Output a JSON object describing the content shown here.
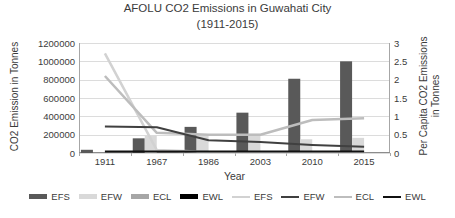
{
  "title": {
    "line1": "AFOLU CO2 Emissions in Guwahati City",
    "line2": "(1911-2015)"
  },
  "axes": {
    "left": {
      "label": "CO2 Emission in Tonnes"
    },
    "right": {
      "label_line1": "Per Capita CO2 Emissions",
      "label_line2": "in Tonnes"
    },
    "x": {
      "label": "Year"
    }
  },
  "chart_data": {
    "type": "combo-bar-line",
    "title": "AFOLU CO2 Emissions in Guwahati City (1911-2015)",
    "categories": [
      "1911",
      "1967",
      "1986",
      "2003",
      "2010",
      "2015"
    ],
    "left_axis": {
      "label": "CO2 Emission in Tonnes",
      "min": 0,
      "max": 1200000,
      "step": 200000,
      "tick_labels": [
        "1200000",
        "1000000",
        "800000",
        "600000",
        "400000",
        "200000",
        "0"
      ]
    },
    "right_axis": {
      "label": "Per Capita CO2 Emissions in Tonnes",
      "min": 0,
      "max": 3,
      "step": 0.5,
      "tick_labels": [
        "3",
        "2.5",
        "2",
        "1.5",
        "1",
        "0.5",
        "0"
      ]
    },
    "bar_series": [
      {
        "name": "EFS",
        "axis": "left",
        "color": "#595959",
        "values": [
          35000,
          160000,
          285000,
          440000,
          810000,
          1000000
        ]
      },
      {
        "name": "EFW",
        "axis": "left",
        "color": "#D9D9D9",
        "values": [
          0,
          190000,
          200000,
          210000,
          150000,
          165000
        ]
      },
      {
        "name": "ECL",
        "axis": "left",
        "color": "#A6A6A6",
        "values": [
          0,
          0,
          0,
          0,
          0,
          0
        ]
      },
      {
        "name": "EWL",
        "axis": "left",
        "color": "#000000",
        "values": [
          0,
          0,
          0,
          0,
          0,
          0
        ]
      }
    ],
    "line_series": [
      {
        "name": "EFS",
        "axis": "right",
        "color": "#D2D2D2",
        "width": 2.5,
        "values": [
          2.72,
          0.08,
          0.03,
          0.02,
          0.02,
          0.02
        ]
      },
      {
        "name": "ECL",
        "axis": "right",
        "color": "#BDBDBD",
        "width": 2.5,
        "values": [
          2.1,
          0.55,
          0.5,
          0.5,
          0.9,
          0.95
        ]
      },
      {
        "name": "EFW",
        "axis": "right",
        "color": "#404040",
        "width": 2,
        "values": [
          0.72,
          0.7,
          0.35,
          0.3,
          0.22,
          0.17
        ]
      },
      {
        "name": "EWL",
        "axis": "right",
        "color": "#111111",
        "width": 2,
        "values": [
          0.04,
          0.04,
          0.04,
          0.04,
          0.04,
          0.04
        ]
      }
    ],
    "grid": true,
    "legend_position": "bottom"
  },
  "legend": {
    "items": [
      {
        "label": "EFS",
        "type": "bar",
        "color": "#595959"
      },
      {
        "label": "EFW",
        "type": "bar",
        "color": "#D9D9D9"
      },
      {
        "label": "ECL",
        "type": "bar",
        "color": "#A6A6A6"
      },
      {
        "label": "EWL",
        "type": "bar",
        "color": "#000000"
      },
      {
        "label": "EFS",
        "type": "line",
        "color": "#D2D2D2"
      },
      {
        "label": "EFW",
        "type": "line",
        "color": "#404040"
      },
      {
        "label": "ECL",
        "type": "line",
        "color": "#BDBDBD"
      },
      {
        "label": "EWL",
        "type": "line",
        "color": "#111111"
      }
    ]
  },
  "colors": {
    "gridline": "#DCDCDC",
    "axis_line": "#A6A6A6",
    "text": "#3b3b3b",
    "background": "#ffffff"
  }
}
